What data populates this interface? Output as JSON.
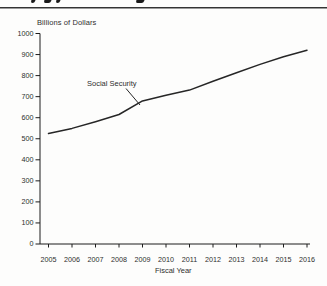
{
  "colors": {
    "line": "#262626",
    "axis": "#1c1c1c",
    "text": "#2e2e2e",
    "background": "#fdfdfc"
  },
  "chart_data": {
    "type": "line",
    "title": "",
    "xlabel": "Fiscal Year",
    "ylabel": "Billions of Dollars",
    "categories": [
      "2005",
      "2006",
      "2007",
      "2008",
      "2009",
      "2010",
      "2011",
      "2012",
      "2013",
      "2014",
      "2015",
      "2016"
    ],
    "series": [
      {
        "name": "Social Security",
        "values": [
          525,
          549,
          581,
          615,
          680,
          707,
          731,
          773,
          814,
          853,
          890,
          920
        ]
      }
    ],
    "ylim": [
      0,
      1000
    ],
    "yticks": [
      0,
      100,
      200,
      300,
      400,
      500,
      600,
      700,
      800,
      900,
      1000
    ],
    "grid": false,
    "legend_position": "none",
    "annotation": {
      "text": "Social Security"
    }
  }
}
